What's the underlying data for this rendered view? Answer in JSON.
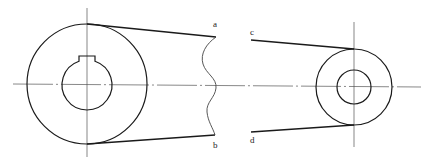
{
  "diagram": {
    "type": "belt-drive-sketch",
    "labels": {
      "a": "a",
      "b": "b",
      "c": "c",
      "d": "d"
    },
    "pulleys": [
      {
        "name": "large-pulley",
        "center": [
          87,
          84
        ],
        "outer_radius": 60,
        "bore_radius": 25,
        "keyway": true
      },
      {
        "name": "small-pulley",
        "center": [
          354,
          87
        ],
        "outer_radius": 38,
        "bore_radius": 17,
        "keyway": false
      }
    ],
    "belt_segments": [
      {
        "from_label": "a",
        "side": "upper-left"
      },
      {
        "from_label": "b",
        "side": "lower-left"
      },
      {
        "from_label": "c",
        "side": "upper-right"
      },
      {
        "from_label": "d",
        "side": "lower-right"
      }
    ],
    "colors": {
      "line": "#1a1a1a",
      "center_line": "#555555",
      "background": "#ffffff"
    }
  }
}
